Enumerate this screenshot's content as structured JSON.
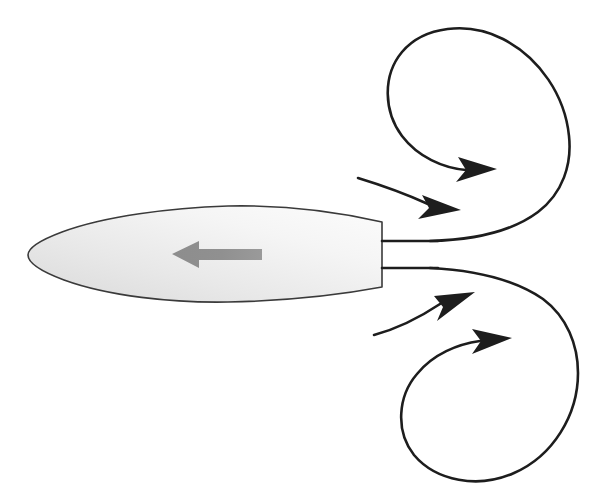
{
  "figure": {
    "title": "Vortex wake behind a streamlined body",
    "background_color": "#ffffff",
    "width": 614,
    "height": 497
  },
  "colors": {
    "line_dark": "#1d1d1d",
    "body_outline": "#3a3a3a",
    "body_fill_light": "#fafafa",
    "body_fill_mid": "#ededed",
    "body_fill_dark": "#d9d9d9",
    "thrust_arrow_gray": "#8a8a8a",
    "background": "#ffffff"
  },
  "body": {
    "name": "streamlined-body",
    "shape": "teardrop-truncated",
    "nose_x": 28,
    "tail_x": 382,
    "centerline_y": 254,
    "max_half_height": 48,
    "fill": "gradient-gray",
    "outline_width": 1.6
  },
  "thrust_arrow": {
    "name": "thrust-direction-arrow",
    "direction": "left",
    "color": "#8a8a8a",
    "tip_x": 172,
    "tail_x": 262,
    "y": 254,
    "shaft_thickness": 11,
    "head_length": 26,
    "head_half_height": 14
  },
  "jet_lines": [
    {
      "name": "upper-shear-layer",
      "y": 241,
      "x_start": 382,
      "x_end": 430
    },
    {
      "name": "lower-shear-layer",
      "y": 268,
      "x_start": 382,
      "x_end": 430
    }
  ],
  "vortices": [
    {
      "name": "upper-vortex",
      "rotation": "clockwise",
      "center_x": 481,
      "center_y": 121,
      "radius": 89,
      "arrow_tip_x": 486,
      "arrow_tip_y": 170
    },
    {
      "name": "lower-vortex",
      "rotation": "counter-clockwise",
      "center_x": 492,
      "center_y": 388,
      "radius": 87,
      "arrow_tip_x": 486,
      "arrow_tip_y": 339
    }
  ],
  "freestream_arrows": [
    {
      "name": "upper-freestream-arrow",
      "start_x": 358,
      "start_y": 178,
      "tip_x": 449,
      "tip_y": 205
    },
    {
      "name": "lower-freestream-arrow",
      "start_x": 374,
      "start_y": 335,
      "tip_x": 465,
      "tip_y": 297
    }
  ],
  "labels": {
    "none_visible": ""
  }
}
